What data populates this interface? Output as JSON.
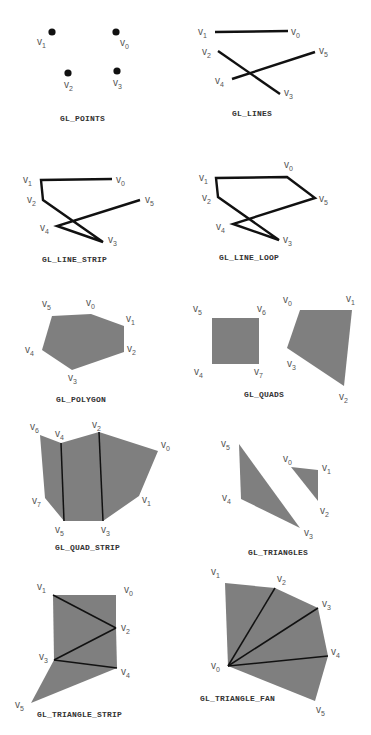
{
  "colors": {
    "fill": "#7f7f7f",
    "line": "#111111",
    "label": "#555555",
    "caption": "#333333"
  },
  "primitives": [
    {
      "id": "points",
      "caption": "GL_POINTS",
      "kind": "points",
      "vertices": [
        {
          "name": "v0",
          "x": 116,
          "y": 32
        },
        {
          "name": "v1",
          "x": 52,
          "y": 32
        },
        {
          "name": "v2",
          "x": 68,
          "y": 73
        },
        {
          "name": "v3",
          "x": 117,
          "y": 71
        }
      ],
      "labels": [
        {
          "text": "v",
          "sub": "0",
          "x": 120,
          "y": 46
        },
        {
          "text": "v",
          "sub": "1",
          "x": 37,
          "y": 45
        },
        {
          "text": "v",
          "sub": "2",
          "x": 64,
          "y": 88
        },
        {
          "text": "v",
          "sub": "3",
          "x": 113,
          "y": 86
        }
      ],
      "caption_pos": {
        "x": 60,
        "y": 121
      }
    },
    {
      "id": "lines",
      "caption": "GL_LINES",
      "kind": "lines",
      "vertices": [
        {
          "name": "v0",
          "x": 288,
          "y": 31
        },
        {
          "name": "v1",
          "x": 215,
          "y": 32
        },
        {
          "name": "v2",
          "x": 218,
          "y": 51
        },
        {
          "name": "v3",
          "x": 280,
          "y": 94
        },
        {
          "name": "v4",
          "x": 232,
          "y": 79
        },
        {
          "name": "v5",
          "x": 315,
          "y": 52
        }
      ],
      "segments": [
        [
          0,
          1
        ],
        [
          2,
          3
        ],
        [
          4,
          5
        ]
      ],
      "labels": [
        {
          "text": "v",
          "sub": "0",
          "x": 291,
          "y": 35
        },
        {
          "text": "v",
          "sub": "1",
          "x": 198,
          "y": 35
        },
        {
          "text": "v",
          "sub": "2",
          "x": 202,
          "y": 55
        },
        {
          "text": "v",
          "sub": "3",
          "x": 284,
          "y": 96
        },
        {
          "text": "v",
          "sub": "4",
          "x": 215,
          "y": 84
        },
        {
          "text": "v",
          "sub": "5",
          "x": 319,
          "y": 54
        }
      ],
      "caption_pos": {
        "x": 232,
        "y": 116
      }
    },
    {
      "id": "line_strip",
      "caption": "GL_LINE_STRIP",
      "kind": "line_strip",
      "vertices": [
        {
          "name": "v0",
          "x": 112,
          "y": 179
        },
        {
          "name": "v1",
          "x": 41,
          "y": 180
        },
        {
          "name": "v2",
          "x": 43,
          "y": 200
        },
        {
          "name": "v3",
          "x": 103,
          "y": 242
        },
        {
          "name": "v4",
          "x": 57,
          "y": 226
        },
        {
          "name": "v5",
          "x": 140,
          "y": 200
        }
      ],
      "labels": [
        {
          "text": "v",
          "sub": "0",
          "x": 116,
          "y": 183
        },
        {
          "text": "v",
          "sub": "1",
          "x": 23,
          "y": 183
        },
        {
          "text": "v",
          "sub": "2",
          "x": 27,
          "y": 203
        },
        {
          "text": "v",
          "sub": "3",
          "x": 108,
          "y": 243
        },
        {
          "text": "v",
          "sub": "4",
          "x": 40,
          "y": 231
        },
        {
          "text": "v",
          "sub": "5",
          "x": 145,
          "y": 203
        }
      ],
      "caption_pos": {
        "x": 42,
        "y": 262
      }
    },
    {
      "id": "line_loop",
      "caption": "GL_LINE_LOOP",
      "kind": "line_loop",
      "vertices": [
        {
          "name": "v0",
          "x": 287,
          "y": 177
        },
        {
          "name": "v1",
          "x": 216,
          "y": 178
        },
        {
          "name": "v2",
          "x": 218,
          "y": 197
        },
        {
          "name": "v3",
          "x": 279,
          "y": 240
        },
        {
          "name": "v4",
          "x": 233,
          "y": 224
        },
        {
          "name": "v5",
          "x": 315,
          "y": 198
        }
      ],
      "labels": [
        {
          "text": "v",
          "sub": "0",
          "x": 284,
          "y": 168
        },
        {
          "text": "v",
          "sub": "1",
          "x": 199,
          "y": 181
        },
        {
          "text": "v",
          "sub": "2",
          "x": 202,
          "y": 201
        },
        {
          "text": "v",
          "sub": "3",
          "x": 283,
          "y": 243
        },
        {
          "text": "v",
          "sub": "4",
          "x": 216,
          "y": 230
        },
        {
          "text": "v",
          "sub": "5",
          "x": 319,
          "y": 202
        }
      ],
      "caption_pos": {
        "x": 219,
        "y": 260
      }
    },
    {
      "id": "polygon",
      "caption": "GL_POLYGON",
      "kind": "polygon",
      "vertices": [
        {
          "name": "v0",
          "x": 91,
          "y": 314
        },
        {
          "name": "v1",
          "x": 124,
          "y": 326
        },
        {
          "name": "v2",
          "x": 124,
          "y": 352
        },
        {
          "name": "v3",
          "x": 72,
          "y": 370
        },
        {
          "name": "v4",
          "x": 42,
          "y": 350
        },
        {
          "name": "v5",
          "x": 52,
          "y": 316
        }
      ],
      "labels": [
        {
          "text": "v",
          "sub": "0",
          "x": 86,
          "y": 306
        },
        {
          "text": "v",
          "sub": "1",
          "x": 126,
          "y": 322
        },
        {
          "text": "v",
          "sub": "2",
          "x": 127,
          "y": 352
        },
        {
          "text": "v",
          "sub": "3",
          "x": 68,
          "y": 381
        },
        {
          "text": "v",
          "sub": "4",
          "x": 25,
          "y": 353
        },
        {
          "text": "v",
          "sub": "5",
          "x": 42,
          "y": 307
        }
      ],
      "caption_pos": {
        "x": 56,
        "y": 402
      }
    },
    {
      "id": "quads",
      "caption": "GL_QUADS",
      "kind": "quads",
      "quads": [
        [
          {
            "name": "v0",
            "x": 300,
            "y": 310
          },
          {
            "name": "v1",
            "x": 352,
            "y": 310
          },
          {
            "name": "v2",
            "x": 344,
            "y": 386
          },
          {
            "name": "v3",
            "x": 287,
            "y": 348
          }
        ],
        [
          {
            "name": "v4",
            "x": 212,
            "y": 364
          },
          {
            "name": "v5",
            "x": 212,
            "y": 318
          },
          {
            "name": "v6",
            "x": 259,
            "y": 318
          },
          {
            "name": "v7",
            "x": 259,
            "y": 364
          }
        ]
      ],
      "labels": [
        {
          "text": "v",
          "sub": "0",
          "x": 283,
          "y": 303
        },
        {
          "text": "v",
          "sub": "1",
          "x": 346,
          "y": 302
        },
        {
          "text": "v",
          "sub": "2",
          "x": 339,
          "y": 400
        },
        {
          "text": "v",
          "sub": "3",
          "x": 287,
          "y": 367
        },
        {
          "text": "v",
          "sub": "4",
          "x": 194,
          "y": 375
        },
        {
          "text": "v",
          "sub": "5",
          "x": 193,
          "y": 312
        },
        {
          "text": "v",
          "sub": "6",
          "x": 257,
          "y": 312
        },
        {
          "text": "v",
          "sub": "7",
          "x": 254,
          "y": 375
        }
      ],
      "caption_pos": {
        "x": 244,
        "y": 397
      }
    },
    {
      "id": "quad_strip",
      "caption": "GL_QUAD_STRIP",
      "kind": "quad_strip",
      "vertices": [
        {
          "name": "v0",
          "x": 158,
          "y": 451
        },
        {
          "name": "v1",
          "x": 139,
          "y": 496
        },
        {
          "name": "v2",
          "x": 99,
          "y": 432
        },
        {
          "name": "v3",
          "x": 103,
          "y": 521
        },
        {
          "name": "v4",
          "x": 61,
          "y": 443
        },
        {
          "name": "v5",
          "x": 64,
          "y": 521
        },
        {
          "name": "v6",
          "x": 40,
          "y": 435
        },
        {
          "name": "v7",
          "x": 45,
          "y": 498
        }
      ],
      "labels": [
        {
          "text": "v",
          "sub": "0",
          "x": 161,
          "y": 448
        },
        {
          "text": "v",
          "sub": "1",
          "x": 142,
          "y": 503
        },
        {
          "text": "v",
          "sub": "2",
          "x": 92,
          "y": 428
        },
        {
          "text": "v",
          "sub": "3",
          "x": 101,
          "y": 533
        },
        {
          "text": "v",
          "sub": "4",
          "x": 55,
          "y": 437
        },
        {
          "text": "v",
          "sub": "5",
          "x": 55,
          "y": 533
        },
        {
          "text": "v",
          "sub": "6",
          "x": 30,
          "y": 430
        },
        {
          "text": "v",
          "sub": "7",
          "x": 32,
          "y": 504
        }
      ],
      "caption_pos": {
        "x": 55,
        "y": 550
      }
    },
    {
      "id": "triangles",
      "caption": "GL_TRIANGLES",
      "kind": "triangles",
      "triangles": [
        [
          {
            "name": "v0",
            "x": 291,
            "y": 467
          },
          {
            "name": "v1",
            "x": 318,
            "y": 470
          },
          {
            "name": "v2",
            "x": 318,
            "y": 501
          }
        ],
        [
          {
            "name": "v3",
            "x": 300,
            "y": 528
          },
          {
            "name": "v4",
            "x": 241,
            "y": 499
          },
          {
            "name": "v5",
            "x": 239,
            "y": 444
          }
        ]
      ],
      "labels": [
        {
          "text": "v",
          "sub": "0",
          "x": 283,
          "y": 462
        },
        {
          "text": "v",
          "sub": "1",
          "x": 322,
          "y": 471
        },
        {
          "text": "v",
          "sub": "2",
          "x": 320,
          "y": 514
        },
        {
          "text": "v",
          "sub": "3",
          "x": 304,
          "y": 536
        },
        {
          "text": "v",
          "sub": "4",
          "x": 222,
          "y": 501
        },
        {
          "text": "v",
          "sub": "5",
          "x": 221,
          "y": 447
        }
      ],
      "caption_pos": {
        "x": 248,
        "y": 555
      }
    },
    {
      "id": "triangle_strip",
      "caption": "GL_TRIANGLE_STRIP",
      "kind": "triangle_strip",
      "vertices": [
        {
          "name": "v0",
          "x": 116,
          "y": 595
        },
        {
          "name": "v1",
          "x": 53,
          "y": 595
        },
        {
          "name": "v2",
          "x": 116,
          "y": 628
        },
        {
          "name": "v3",
          "x": 54,
          "y": 660
        },
        {
          "name": "v4",
          "x": 117,
          "y": 668
        },
        {
          "name": "v5",
          "x": 31,
          "y": 703
        }
      ],
      "labels": [
        {
          "text": "v",
          "sub": "0",
          "x": 124,
          "y": 593
        },
        {
          "text": "v",
          "sub": "1",
          "x": 37,
          "y": 590
        },
        {
          "text": "v",
          "sub": "2",
          "x": 121,
          "y": 631
        },
        {
          "text": "v",
          "sub": "3",
          "x": 39,
          "y": 660
        },
        {
          "text": "v",
          "sub": "4",
          "x": 121,
          "y": 675
        },
        {
          "text": "v",
          "sub": "5",
          "x": 15,
          "y": 708
        }
      ],
      "caption_pos": {
        "x": 37,
        "y": 717
      }
    },
    {
      "id": "triangle_fan",
      "caption": "GL_TRIANGLE_FAN",
      "kind": "triangle_fan",
      "vertices": [
        {
          "name": "v0",
          "x": 228,
          "y": 666
        },
        {
          "name": "v1",
          "x": 225,
          "y": 583
        },
        {
          "name": "v2",
          "x": 275,
          "y": 588
        },
        {
          "name": "v3",
          "x": 318,
          "y": 608
        },
        {
          "name": "v4",
          "x": 328,
          "y": 656
        },
        {
          "name": "v5",
          "x": 315,
          "y": 701
        }
      ],
      "labels": [
        {
          "text": "v",
          "sub": "0",
          "x": 211,
          "y": 669
        },
        {
          "text": "v",
          "sub": "1",
          "x": 211,
          "y": 575
        },
        {
          "text": "v",
          "sub": "2",
          "x": 277,
          "y": 582
        },
        {
          "text": "v",
          "sub": "3",
          "x": 322,
          "y": 607
        },
        {
          "text": "v",
          "sub": "4",
          "x": 331,
          "y": 655
        },
        {
          "text": "v",
          "sub": "5",
          "x": 316,
          "y": 713
        }
      ],
      "caption_pos": {
        "x": 200,
        "y": 701
      }
    }
  ]
}
